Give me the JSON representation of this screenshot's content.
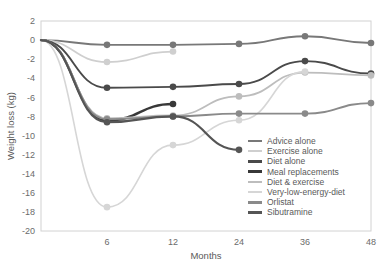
{
  "chart_data": {
    "type": "line",
    "title": "",
    "xlabel": "Months",
    "ylabel": "Weight loss (kg)",
    "x": [
      0,
      6,
      12,
      24,
      36,
      48
    ],
    "xtick_labels": [
      "",
      "6",
      "12",
      "24",
      "36",
      "48"
    ],
    "ylim": [
      -20,
      2
    ],
    "ytick_labels": [
      "2",
      "0",
      "-2",
      "-4",
      "-6",
      "-8",
      "-10",
      "-12",
      "-14",
      "-16",
      "-18",
      "-20"
    ],
    "ytick_values": [
      2,
      0,
      -2,
      -4,
      -6,
      -8,
      -10,
      -12,
      -14,
      -16,
      -18,
      -20
    ],
    "grid": false,
    "legend_position": "inside-lower-right",
    "series": [
      {
        "name": "Advice alone",
        "color": "#787878",
        "width": 1.9,
        "marker": true,
        "x": [
          0,
          6,
          12,
          24,
          36,
          48
        ],
        "values": [
          0,
          -0.5,
          -0.5,
          -0.4,
          0.4,
          -0.3
        ]
      },
      {
        "name": "Exercise alone",
        "color": "#cfcfcf",
        "width": 1.7,
        "marker": true,
        "x": [
          0,
          6,
          12,
          24,
          36
        ],
        "values": [
          0,
          -2.3,
          -1.2,
          null,
          null
        ]
      },
      {
        "name": "Diet alone",
        "color": "#4a4a4a",
        "width": 1.9,
        "marker": true,
        "x": [
          0,
          6,
          12,
          24,
          36,
          48
        ],
        "values": [
          0,
          -5.0,
          -4.9,
          -4.6,
          -2.2,
          -3.5
        ]
      },
      {
        "name": "Meal replacements",
        "color": "#383838",
        "width": 2.4,
        "marker": true,
        "x": [
          0,
          6,
          12
        ],
        "values": [
          0,
          -8.4,
          -6.7
        ]
      },
      {
        "name": "Diet & exercise",
        "color": "#bdbdbd",
        "width": 1.8,
        "marker": true,
        "x": [
          0,
          6,
          12,
          24,
          36,
          48
        ],
        "values": [
          0,
          -8.2,
          -7.9,
          -5.9,
          -3.4,
          -3.7
        ]
      },
      {
        "name": "Very-low-energy-diet",
        "color": "#d6d6d6",
        "width": 1.6,
        "marker": true,
        "x": [
          0,
          6,
          12,
          24,
          36
        ],
        "values": [
          0,
          -17.5,
          -11.0,
          -8.4,
          -3.3
        ]
      },
      {
        "name": "Orlistat",
        "color": "#8a8a8a",
        "width": 1.9,
        "marker": true,
        "x": [
          0,
          6,
          12,
          24,
          36,
          48
        ],
        "values": [
          0,
          -8.3,
          -8.0,
          -7.7,
          -7.7,
          -6.6
        ]
      },
      {
        "name": "Sibutramine",
        "color": "#555555",
        "width": 2.2,
        "marker": true,
        "x": [
          0,
          6,
          12,
          24
        ],
        "values": [
          0,
          -8.6,
          -8.0,
          -11.5
        ]
      }
    ]
  },
  "legend": {
    "items": [
      {
        "label": "Advice alone",
        "color": "#787878",
        "thickness": 2.6
      },
      {
        "label": "Exercise alone",
        "color": "#cfcfcf",
        "thickness": 2.4
      },
      {
        "label": "Diet alone",
        "color": "#4a4a4a",
        "thickness": 2.6
      },
      {
        "label": "Meal replacements",
        "color": "#383838",
        "thickness": 3.0
      },
      {
        "label": "Diet & exercise",
        "color": "#bdbdbd",
        "thickness": 2.4
      },
      {
        "label": "Very-low-energy-diet",
        "color": "#d6d6d6",
        "thickness": 2.2
      },
      {
        "label": "Orlistat",
        "color": "#8a8a8a",
        "thickness": 2.6
      },
      {
        "label": "Sibutramine",
        "color": "#555555",
        "thickness": 2.8
      }
    ]
  },
  "axes": {
    "frame_color": "#d2d2d2",
    "text_color": "#6b6b6b"
  }
}
